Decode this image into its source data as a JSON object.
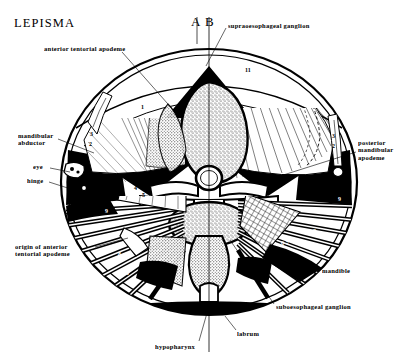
{
  "figure": {
    "title": "LEPISMA",
    "width": 419,
    "height": 362,
    "background": "#ffffff",
    "ink": "#000000"
  },
  "section_markers": {
    "left": "A",
    "right": "B",
    "divider": "vertical-midline"
  },
  "labels": [
    {
      "id": "anterior-tentorial-apodeme",
      "text": "anterior tentorial apodeme",
      "x": 44,
      "y": 45,
      "align": "left"
    },
    {
      "id": "supraoesophageal-ganglion",
      "text": "supraoesophageal ganglion",
      "x": 228,
      "y": 22,
      "align": "left"
    },
    {
      "id": "mandibular-abductor",
      "text": "mandibular\nabductor",
      "x": 18,
      "y": 132,
      "align": "left"
    },
    {
      "id": "eye",
      "text": "eye",
      "x": 33,
      "y": 163,
      "align": "left"
    },
    {
      "id": "hinge",
      "text": "hinge",
      "x": 27,
      "y": 177,
      "align": "left"
    },
    {
      "id": "posterior-mandibular-apodeme",
      "text": "posterior\nmandibular\napodeme",
      "x": 358,
      "y": 139,
      "align": "left"
    },
    {
      "id": "origin-of-anterior-tentorial-apodeme",
      "text": "origin of anterior\ntentorial apodeme",
      "x": 15,
      "y": 243,
      "align": "left"
    },
    {
      "id": "mandible",
      "text": "mandible",
      "x": 322,
      "y": 267,
      "align": "left"
    },
    {
      "id": "suboesophageal-ganglion",
      "text": "suboesophageal ganglion",
      "x": 276,
      "y": 303,
      "align": "left"
    },
    {
      "id": "labrum",
      "text": "labrum",
      "x": 237,
      "y": 330,
      "align": "left"
    },
    {
      "id": "hypopharynx",
      "text": "hypopharynx",
      "x": 155,
      "y": 343,
      "align": "left"
    }
  ],
  "muscle_numbers": [
    {
      "text": "11",
      "x": 245,
      "y": 67,
      "color": "dark"
    },
    {
      "text": "1",
      "x": 141,
      "y": 104,
      "color": "dark"
    },
    {
      "text": "3",
      "x": 90,
      "y": 131,
      "color": "dark"
    },
    {
      "text": "2",
      "x": 89,
      "y": 141,
      "color": "dark"
    },
    {
      "text": "3",
      "x": 332,
      "y": 133,
      "color": "dark"
    },
    {
      "text": "2",
      "x": 332,
      "y": 143,
      "color": "dark"
    },
    {
      "text": "4",
      "x": 134,
      "y": 185,
      "color": "light"
    },
    {
      "text": "5",
      "x": 142,
      "y": 192,
      "color": "light"
    },
    {
      "text": "9",
      "x": 105,
      "y": 208,
      "color": "light"
    },
    {
      "text": "9",
      "x": 338,
      "y": 196,
      "color": "light"
    },
    {
      "text": "8",
      "x": 313,
      "y": 228,
      "color": "light"
    },
    {
      "text": "6-7",
      "x": 281,
      "y": 240,
      "color": "light"
    },
    {
      "text": "8",
      "x": 118,
      "y": 251,
      "color": "light"
    },
    {
      "text": "10",
      "x": 123,
      "y": 270,
      "color": "light"
    }
  ],
  "leader_lines": [
    {
      "id": "anterior-tentorial-apodeme-leader",
      "points": "122,52 175,108"
    },
    {
      "id": "supraoesophageal-ganglion-leader",
      "points": "226,28 208,60"
    },
    {
      "id": "mandibular-abductor-leader",
      "points": "60,139 92,152"
    },
    {
      "id": "eye-leader",
      "points": "50,168 73,174"
    },
    {
      "id": "hinge-leader",
      "points": "49,182 76,190"
    },
    {
      "id": "posterior-mandibular-apodeme-leader",
      "points": "356,152 258,182"
    },
    {
      "id": "origin-leader",
      "points": "96,247 126,240"
    },
    {
      "id": "mandible-leader",
      "points": "320,268 303,256"
    },
    {
      "id": "suboesophageal-ganglion-leader",
      "points": "274,304 232,244"
    },
    {
      "id": "labrum-leader",
      "points": "236,330 224,316"
    },
    {
      "id": "hypopharynx-leader",
      "points": "198,342 208,310"
    }
  ],
  "anatomy_regions": [
    {
      "id": "head-capsule-outline",
      "description": "outer oval head capsule wall"
    },
    {
      "id": "brain",
      "description": "supraoesophageal ganglion, stippled pear shape, upper midline"
    },
    {
      "id": "oesophagus",
      "description": "small circular lumen below brain"
    },
    {
      "id": "suboesophageal-ganglion",
      "description": "stippled oval below oesophagus"
    },
    {
      "id": "tentorium",
      "description": "bridging cross-bar structure"
    },
    {
      "id": "labrum",
      "description": "solid black crescent at ventral margin"
    },
    {
      "id": "hypopharynx",
      "description": "median ventral lobe"
    },
    {
      "id": "left-adductor-fan",
      "description": "radiating striated muscle fan, left"
    },
    {
      "id": "right-adductor-fan",
      "description": "radiating striated muscle fan, right"
    },
    {
      "id": "left-mandible",
      "description": "dark mandible mass lower left"
    },
    {
      "id": "right-mandible",
      "description": "dark mandible mass lower right"
    }
  ]
}
